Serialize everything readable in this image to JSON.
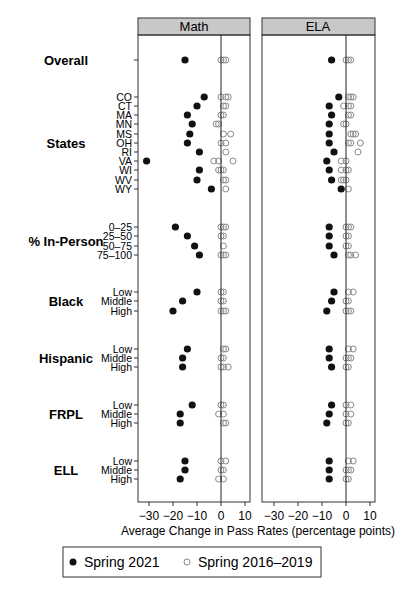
{
  "chart_data": {
    "type": "scatter",
    "subtype": "dot-plot (faceted)",
    "panels": [
      "Math",
      "ELA"
    ],
    "xlabel": "Average Change in Pass Rates (percentage points)",
    "xticks": [
      -30,
      -20,
      -10,
      0,
      10
    ],
    "xlim": [
      -35,
      13
    ],
    "reference_line": 0,
    "legend": {
      "position": "bottom",
      "entries": [
        {
          "label": "Spring 2021",
          "marker": "filled-circle",
          "color": "#111111"
        },
        {
          "label": "Spring 2016–2019",
          "marker": "open-circle",
          "color": "#8a8a8a"
        }
      ]
    },
    "groups": [
      {
        "name": "Overall",
        "rows": [
          {
            "label": "",
            "math_2021": -15,
            "math_prior": [
              0,
              1,
              2
            ],
            "ela_2021": -6,
            "ela_prior": [
              0,
              1,
              2
            ]
          }
        ]
      },
      {
        "name": "States",
        "rows": [
          {
            "label": "CO",
            "math_2021": -7,
            "math_prior": [
              0,
              2,
              3
            ],
            "ela_2021": -3,
            "ela_prior": [
              1,
              2,
              3
            ]
          },
          {
            "label": "CT",
            "math_2021": -10,
            "math_prior": [
              1,
              2
            ],
            "ela_2021": -7,
            "ela_prior": [
              -1,
              1,
              2
            ]
          },
          {
            "label": "MA",
            "math_2021": -14,
            "math_prior": [
              0,
              1
            ],
            "ela_2021": -6,
            "ela_prior": [
              1,
              2
            ]
          },
          {
            "label": "MN",
            "math_2021": -12,
            "math_prior": [
              -2,
              -1
            ],
            "ela_2021": -7,
            "ela_prior": [
              -1,
              0
            ]
          },
          {
            "label": "MS",
            "math_2021": -13,
            "math_prior": [
              1,
              4
            ],
            "ela_2021": -7,
            "ela_prior": [
              2,
              3,
              4
            ]
          },
          {
            "label": "OH",
            "math_2021": -14,
            "math_prior": [
              0,
              2
            ],
            "ela_2021": -7,
            "ela_prior": [
              1,
              2,
              6
            ]
          },
          {
            "label": "RI",
            "math_2021": -9,
            "math_prior": [
              2
            ],
            "ela_2021": -5,
            "ela_prior": [
              5
            ]
          },
          {
            "label": "VA",
            "math_2021": -31,
            "math_prior": [
              -3,
              -1,
              5
            ],
            "ela_2021": -8,
            "ela_prior": [
              -2,
              0
            ]
          },
          {
            "label": "WI",
            "math_2021": -9,
            "math_prior": [
              -1,
              0,
              1
            ],
            "ela_2021": -7,
            "ela_prior": [
              -2,
              0,
              1
            ]
          },
          {
            "label": "WV",
            "math_2021": -10,
            "math_prior": [
              1,
              2
            ],
            "ela_2021": -6,
            "ela_prior": [
              -2,
              -1,
              0
            ]
          },
          {
            "label": "WY",
            "math_2021": -4,
            "math_prior": [
              2
            ],
            "ela_2021": -2,
            "ela_prior": [
              1
            ]
          }
        ]
      },
      {
        "name": "% In-Person",
        "rows": [
          {
            "label": "0–25",
            "math_2021": -19,
            "math_prior": [
              0,
              1,
              2
            ],
            "ela_2021": -7,
            "ela_prior": [
              0,
              1,
              2
            ]
          },
          {
            "label": "25–50",
            "math_2021": -14,
            "math_prior": [
              0,
              1
            ],
            "ela_2021": -7,
            "ela_prior": [
              0,
              1
            ]
          },
          {
            "label": "50–75",
            "math_2021": -11,
            "math_prior": [
              1
            ],
            "ela_2021": -7,
            "ela_prior": [
              0,
              1
            ]
          },
          {
            "label": "75–100",
            "math_2021": -9,
            "math_prior": [
              0,
              1,
              2
            ],
            "ela_2021": -5,
            "ela_prior": [
              1,
              2,
              4
            ]
          }
        ]
      },
      {
        "name": "Black",
        "rows": [
          {
            "label": "Low",
            "math_2021": -10,
            "math_prior": [
              0,
              1
            ],
            "ela_2021": -5,
            "ela_prior": [
              1,
              3
            ]
          },
          {
            "label": "Middle",
            "math_2021": -16,
            "math_prior": [
              0,
              1
            ],
            "ela_2021": -6,
            "ela_prior": [
              0,
              1
            ]
          },
          {
            "label": "High",
            "math_2021": -20,
            "math_prior": [
              0,
              1,
              2
            ],
            "ela_2021": -8,
            "ela_prior": [
              0,
              1,
              2
            ]
          }
        ]
      },
      {
        "name": "Hispanic",
        "rows": [
          {
            "label": "Low",
            "math_2021": -14,
            "math_prior": [
              1,
              2
            ],
            "ela_2021": -7,
            "ela_prior": [
              1,
              3
            ]
          },
          {
            "label": "Middle",
            "math_2021": -16,
            "math_prior": [
              0,
              1
            ],
            "ela_2021": -7,
            "ela_prior": [
              0,
              1,
              2
            ]
          },
          {
            "label": "High",
            "math_2021": -16,
            "math_prior": [
              0,
              1,
              3
            ],
            "ela_2021": -6,
            "ela_prior": [
              0,
              1
            ]
          }
        ]
      },
      {
        "name": "FRPL",
        "rows": [
          {
            "label": "Low",
            "math_2021": -12,
            "math_prior": [
              0,
              1
            ],
            "ela_2021": -6,
            "ela_prior": [
              0,
              2
            ]
          },
          {
            "label": "Middle",
            "math_2021": -17,
            "math_prior": [
              -1,
              1
            ],
            "ela_2021": -7,
            "ela_prior": [
              0,
              2
            ]
          },
          {
            "label": "High",
            "math_2021": -17,
            "math_prior": [
              1,
              2
            ],
            "ela_2021": -8,
            "ela_prior": [
              0,
              1
            ]
          }
        ]
      },
      {
        "name": "ELL",
        "rows": [
          {
            "label": "Low",
            "math_2021": -15,
            "math_prior": [
              0,
              2
            ],
            "ela_2021": -7,
            "ela_prior": [
              1,
              3
            ]
          },
          {
            "label": "Middle",
            "math_2021": -15,
            "math_prior": [
              0,
              1
            ],
            "ela_2021": -7,
            "ela_prior": [
              0,
              1,
              2
            ]
          },
          {
            "label": "High",
            "math_2021": -17,
            "math_prior": [
              -1,
              1
            ],
            "ela_2021": -7,
            "ela_prior": [
              0,
              1
            ]
          }
        ]
      }
    ]
  },
  "layout": {
    "row_y": {
      "Overall": [
        60
      ],
      "States": [
        97,
        106,
        115,
        124,
        134,
        143,
        152,
        161,
        170,
        180,
        189
      ],
      "% In-Person": [
        227,
        236,
        246,
        255
      ],
      "Black": [
        292,
        301,
        311
      ],
      "Hispanic": [
        349,
        358,
        367
      ],
      "FRPL": [
        405,
        414,
        423
      ],
      "ELL": [
        461,
        470,
        479
      ]
    },
    "group_label_y": {
      "Overall": 60,
      "States": 143,
      "% In-Person": 241,
      "Black": 301,
      "Hispanic": 358,
      "FRPL": 414,
      "ELL": 470
    }
  }
}
